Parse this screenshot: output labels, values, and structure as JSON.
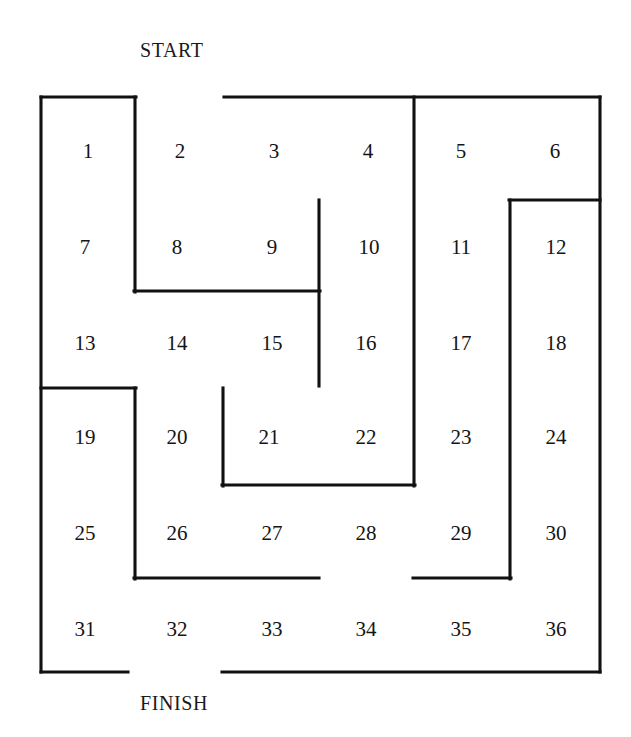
{
  "figure": {
    "type": "maze-diagram",
    "title_top": "START",
    "title_bottom": "FINISH",
    "rows": 6,
    "cols": 6,
    "cell_count": 36,
    "line_color": "#111111",
    "background_color": "#ffffff"
  },
  "cells": [
    {
      "n": "1",
      "row": 1,
      "col": 1,
      "cx": 88,
      "cy": 151
    },
    {
      "n": "2",
      "row": 1,
      "col": 2,
      "cx": 180,
      "cy": 151
    },
    {
      "n": "3",
      "row": 1,
      "col": 3,
      "cx": 274,
      "cy": 151
    },
    {
      "n": "4",
      "row": 1,
      "col": 4,
      "cx": 368,
      "cy": 151
    },
    {
      "n": "5",
      "row": 1,
      "col": 5,
      "cx": 461,
      "cy": 151
    },
    {
      "n": "6",
      "row": 1,
      "col": 6,
      "cx": 555,
      "cy": 151
    },
    {
      "n": "7",
      "row": 2,
      "col": 1,
      "cx": 85,
      "cy": 247
    },
    {
      "n": "8",
      "row": 2,
      "col": 2,
      "cx": 177,
      "cy": 247
    },
    {
      "n": "9",
      "row": 2,
      "col": 3,
      "cx": 272,
      "cy": 247
    },
    {
      "n": "10",
      "row": 2,
      "col": 4,
      "cx": 369,
      "cy": 247
    },
    {
      "n": "11",
      "row": 2,
      "col": 5,
      "cx": 461,
      "cy": 247
    },
    {
      "n": "12",
      "row": 2,
      "col": 6,
      "cx": 556,
      "cy": 247
    },
    {
      "n": "13",
      "row": 3,
      "col": 1,
      "cx": 85,
      "cy": 343
    },
    {
      "n": "14",
      "row": 3,
      "col": 2,
      "cx": 177,
      "cy": 343
    },
    {
      "n": "15",
      "row": 3,
      "col": 3,
      "cx": 272,
      "cy": 343
    },
    {
      "n": "16",
      "row": 3,
      "col": 4,
      "cx": 366,
      "cy": 343
    },
    {
      "n": "17",
      "row": 3,
      "col": 5,
      "cx": 461,
      "cy": 343
    },
    {
      "n": "18",
      "row": 3,
      "col": 6,
      "cx": 556,
      "cy": 343
    },
    {
      "n": "19",
      "row": 4,
      "col": 1,
      "cx": 85,
      "cy": 437
    },
    {
      "n": "20",
      "row": 4,
      "col": 2,
      "cx": 177,
      "cy": 437
    },
    {
      "n": "21",
      "row": 4,
      "col": 3,
      "cx": 269,
      "cy": 437
    },
    {
      "n": "22",
      "row": 4,
      "col": 4,
      "cx": 366,
      "cy": 437
    },
    {
      "n": "23",
      "row": 4,
      "col": 5,
      "cx": 461,
      "cy": 437
    },
    {
      "n": "24",
      "row": 4,
      "col": 6,
      "cx": 556,
      "cy": 437
    },
    {
      "n": "25",
      "row": 5,
      "col": 1,
      "cx": 85,
      "cy": 533
    },
    {
      "n": "26",
      "row": 5,
      "col": 2,
      "cx": 177,
      "cy": 533
    },
    {
      "n": "27",
      "row": 5,
      "col": 3,
      "cx": 272,
      "cy": 533
    },
    {
      "n": "28",
      "row": 5,
      "col": 4,
      "cx": 366,
      "cy": 533
    },
    {
      "n": "29",
      "row": 5,
      "col": 5,
      "cx": 461,
      "cy": 533
    },
    {
      "n": "30",
      "row": 5,
      "col": 6,
      "cx": 556,
      "cy": 533
    },
    {
      "n": "31",
      "row": 6,
      "col": 1,
      "cx": 85,
      "cy": 629
    },
    {
      "n": "32",
      "row": 6,
      "col": 2,
      "cx": 177,
      "cy": 629
    },
    {
      "n": "33",
      "row": 6,
      "col": 3,
      "cx": 272,
      "cy": 629
    },
    {
      "n": "34",
      "row": 6,
      "col": 4,
      "cx": 366,
      "cy": 629
    },
    {
      "n": "35",
      "row": 6,
      "col": 5,
      "cx": 461,
      "cy": 629
    },
    {
      "n": "36",
      "row": 6,
      "col": 6,
      "cx": 556,
      "cy": 629
    }
  ],
  "walls": [
    {
      "name": "top-border-left",
      "x1": 41,
      "y1": 97,
      "x2": 136,
      "y2": 97
    },
    {
      "name": "top-border-right",
      "x1": 224,
      "y1": 97,
      "x2": 600,
      "y2": 97
    },
    {
      "name": "left-border",
      "x1": 41,
      "y1": 97,
      "x2": 41,
      "y2": 672
    },
    {
      "name": "right-border",
      "x1": 600,
      "y1": 97,
      "x2": 600,
      "y2": 672
    },
    {
      "name": "bottom-border-left",
      "x1": 41,
      "y1": 672,
      "x2": 128,
      "y2": 672
    },
    {
      "name": "bottom-border-right",
      "x1": 222,
      "y1": 672,
      "x2": 600,
      "y2": 672
    },
    {
      "name": "wall-1-2-and-7-8",
      "x1": 135,
      "y1": 97,
      "x2": 135,
      "y2": 292
    },
    {
      "name": "wall-under-8-9",
      "x1": 134,
      "y1": 291,
      "x2": 320,
      "y2": 291
    },
    {
      "name": "wall-9-10-and-15-16",
      "x1": 319,
      "y1": 200,
      "x2": 319,
      "y2": 386
    },
    {
      "name": "wall-col4-col5",
      "x1": 414,
      "y1": 97,
      "x2": 414,
      "y2": 486
    },
    {
      "name": "wall-11-12-to-29-30",
      "x1": 510,
      "y1": 200,
      "x2": 510,
      "y2": 579
    },
    {
      "name": "wall-above-12",
      "x1": 509,
      "y1": 200,
      "x2": 600,
      "y2": 200
    },
    {
      "name": "wall-above-19",
      "x1": 41,
      "y1": 388,
      "x2": 136,
      "y2": 388
    },
    {
      "name": "wall-19-20-and-25-26",
      "x1": 135,
      "y1": 388,
      "x2": 135,
      "y2": 579
    },
    {
      "name": "wall-20-21",
      "x1": 223,
      "y1": 388,
      "x2": 223,
      "y2": 486
    },
    {
      "name": "wall-under-21-22",
      "x1": 222,
      "y1": 485,
      "x2": 415,
      "y2": 485
    },
    {
      "name": "wall-under-26-27",
      "x1": 134,
      "y1": 578,
      "x2": 319,
      "y2": 578
    },
    {
      "name": "wall-under-29",
      "x1": 413,
      "y1": 578,
      "x2": 511,
      "y2": 578
    }
  ]
}
